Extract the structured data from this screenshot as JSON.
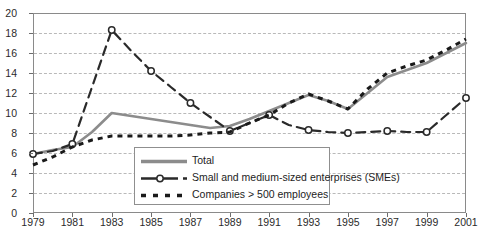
{
  "chart_data": {
    "type": "line",
    "title": "",
    "subtitle": "",
    "xlabel": "",
    "ylabel": "",
    "xlim": [
      1979,
      2001
    ],
    "ylim": [
      0,
      20
    ],
    "grid": true,
    "legend_position": "inside-bottom-left",
    "x": [
      1979,
      1980,
      1981,
      1982,
      1983,
      1984,
      1985,
      1986,
      1987,
      1988,
      1989,
      1990,
      1991,
      1992,
      1993,
      1994,
      1995,
      1996,
      1997,
      1998,
      1999,
      2000,
      2001
    ],
    "xtick_labels": [
      "1979",
      "1981",
      "1983",
      "1985",
      "1987",
      "1989",
      "1991",
      "1993",
      "1995",
      "1997",
      "1999",
      "2001"
    ],
    "xticks": [
      1979,
      1981,
      1983,
      1985,
      1987,
      1989,
      1991,
      1993,
      1995,
      1997,
      1999,
      2001
    ],
    "ytick_labels": [
      "0",
      "2",
      "4",
      "6",
      "8",
      "10",
      "12",
      "14",
      "16",
      "18",
      "20"
    ],
    "yticks": [
      0,
      2,
      4,
      6,
      8,
      10,
      12,
      14,
      16,
      18,
      20
    ],
    "series": [
      {
        "name": "Total",
        "color": "#8c8c8c",
        "style": "solid",
        "marker": "none",
        "values": [
          5.9,
          6.3,
          6.6,
          8.1,
          10.0,
          9.7,
          9.4,
          9.1,
          8.8,
          8.5,
          8.7,
          9.4,
          10.2,
          11.0,
          11.8,
          11.2,
          10.4,
          12.0,
          13.6,
          14.3,
          15.0,
          16.0,
          17.0
        ]
      },
      {
        "name": "Small and medium-sized enterprises (SMEs)",
        "color": "#2a2a2a",
        "style": "long-dash",
        "marker": "open-circle",
        "values": [
          5.9,
          6.2,
          6.9,
          12.6,
          18.3,
          16.2,
          14.2,
          12.6,
          11.0,
          9.6,
          8.2,
          9.0,
          9.8,
          8.8,
          8.3,
          8.1,
          8.0,
          8.1,
          8.2,
          8.1,
          8.1,
          9.8,
          11.5
        ]
      },
      {
        "name": "Companies > 500 employees",
        "color": "#1a1a1a",
        "style": "square-dash",
        "marker": "none",
        "values": [
          4.8,
          5.6,
          6.6,
          7.3,
          7.7,
          7.7,
          7.7,
          7.7,
          7.8,
          8.0,
          8.1,
          9.0,
          9.8,
          11.0,
          11.9,
          11.2,
          10.4,
          12.4,
          14.0,
          14.7,
          15.3,
          16.3,
          17.4
        ]
      }
    ]
  },
  "legend": {
    "entries": [
      {
        "label": "Total",
        "swatch": "solid-gray-line"
      },
      {
        "label": "Small and medium-sized enterprises (SMEs)",
        "swatch": "dash-circle-line"
      },
      {
        "label": "Companies > 500 employees",
        "swatch": "square-dash-line"
      }
    ]
  }
}
